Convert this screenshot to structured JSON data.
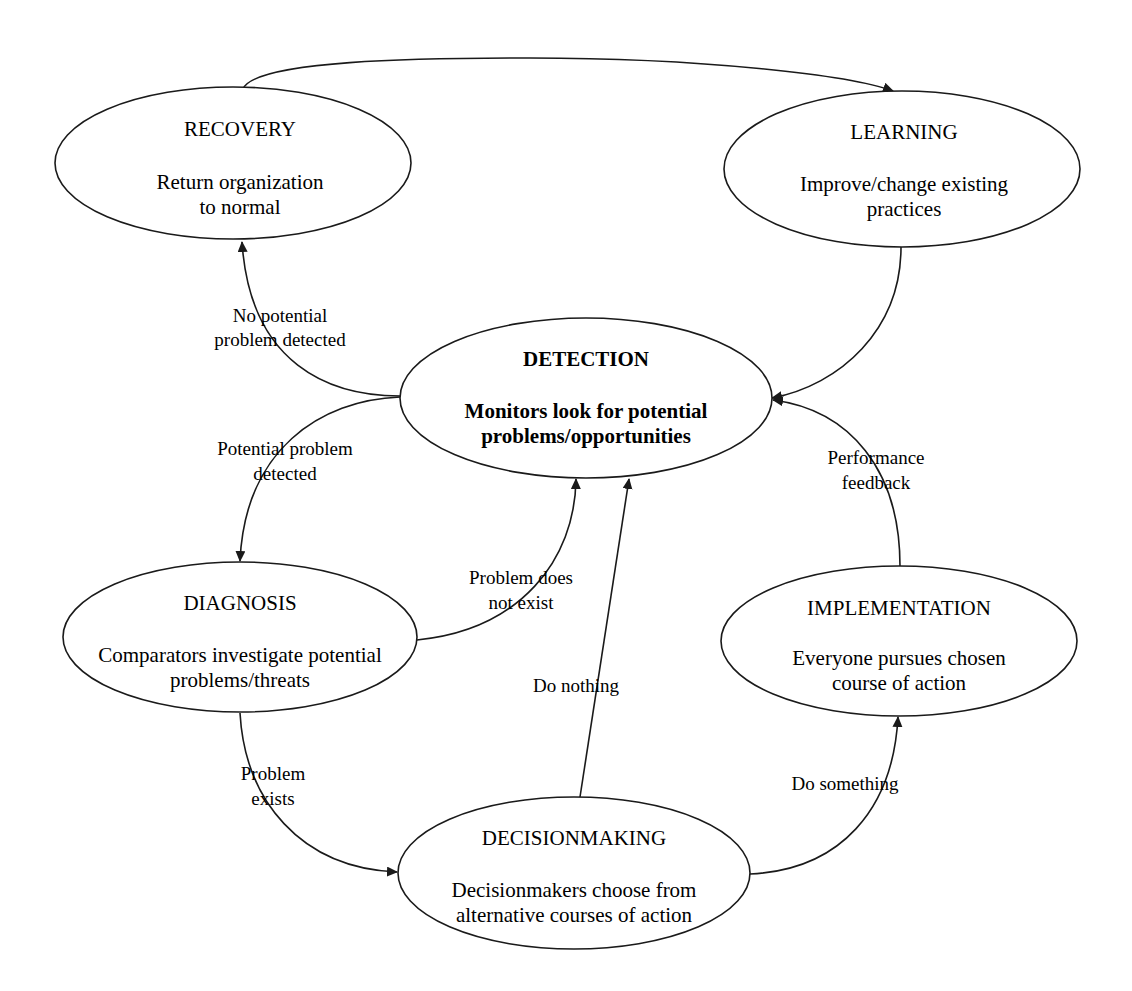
{
  "diagram": {
    "type": "cycle-flow",
    "nodes": {
      "recovery": {
        "title": "RECOVERY",
        "desc": [
          "Return organization",
          "to normal"
        ]
      },
      "learning": {
        "title": "LEARNING",
        "desc": [
          "Improve/change existing",
          "practices"
        ]
      },
      "detection": {
        "title": "DETECTION",
        "desc": [
          "Monitors look for potential",
          "problems/opportunities"
        ]
      },
      "diagnosis": {
        "title": "DIAGNOSIS",
        "desc": [
          "Comparators investigate potential",
          "problems/threats"
        ]
      },
      "implementation": {
        "title": "IMPLEMENTATION",
        "desc": [
          "Everyone pursues chosen",
          "course of action"
        ]
      },
      "decisionmaking": {
        "title": "DECISIONMAKING",
        "desc": [
          "Decisionmakers choose from",
          "alternative courses of action"
        ]
      }
    },
    "edges": {
      "recovery_to_learning": {
        "label": []
      },
      "learning_to_detection": {
        "label": []
      },
      "detection_to_recovery": {
        "label": [
          "No potential",
          "problem detected"
        ]
      },
      "detection_to_diagnosis": {
        "label": [
          "Potential problem",
          "detected"
        ]
      },
      "diagnosis_to_detection": {
        "label": [
          "Problem does",
          "not exist"
        ]
      },
      "diagnosis_to_decisionmaking": {
        "label": [
          "Problem",
          "exists"
        ]
      },
      "decisionmaking_to_detection": {
        "label": [
          "Do nothing"
        ]
      },
      "decisionmaking_to_implementation": {
        "label": [
          "Do something"
        ]
      },
      "implementation_to_detection": {
        "label": [
          "Performance",
          "feedback"
        ]
      }
    }
  }
}
